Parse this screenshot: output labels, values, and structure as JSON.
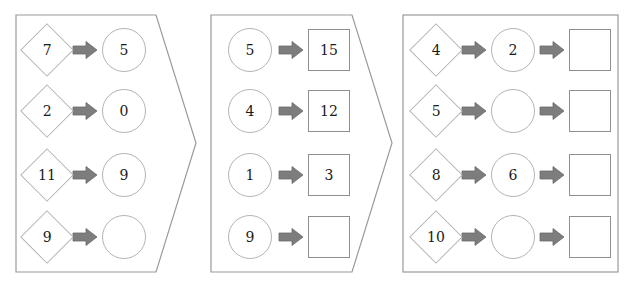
{
  "diagram": {
    "title": "",
    "colors": {
      "panel_stroke": "#9a9a9a",
      "shape_stroke": "#b4b4b4",
      "square_stroke": "#8f8f8f",
      "arrow_fill": "#7d7d7d",
      "text": "#1a1a1a",
      "background": "#ffffff"
    },
    "arrow_icon_name": "right-block-arrow-icon"
  },
  "panels": [
    {
      "id": "panel-1",
      "shape": "right-pointing-pentagon",
      "rows": [
        {
          "diamond": "7",
          "circle": "5"
        },
        {
          "diamond": "2",
          "circle": "0"
        },
        {
          "diamond": "11",
          "circle": "9"
        },
        {
          "diamond": "9",
          "circle": ""
        }
      ]
    },
    {
      "id": "panel-2",
      "shape": "chevron-notched-left-pointed-right",
      "rows": [
        {
          "circle": "5",
          "square": "15"
        },
        {
          "circle": "4",
          "square": "12"
        },
        {
          "circle": "1",
          "square": "3"
        },
        {
          "circle": "9",
          "square": ""
        }
      ]
    },
    {
      "id": "panel-3",
      "shape": "rectangle",
      "rows": [
        {
          "diamond": "4",
          "circle": "2",
          "square": ""
        },
        {
          "diamond": "5",
          "circle": "",
          "square": ""
        },
        {
          "diamond": "8",
          "circle": "6",
          "square": ""
        },
        {
          "diamond": "10",
          "circle": "",
          "square": ""
        }
      ]
    }
  ]
}
